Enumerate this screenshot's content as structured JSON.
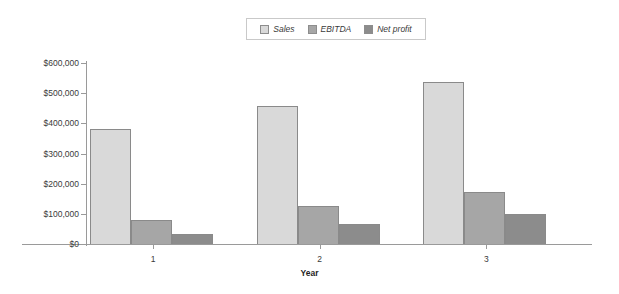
{
  "chart_data": {
    "type": "bar",
    "title": "",
    "xlabel": "Year",
    "ylabel": "",
    "categories": [
      "1",
      "2",
      "3"
    ],
    "series": [
      {
        "name": "Sales",
        "values": [
          380000,
          457000,
          537000
        ],
        "color": "#d9d9d9"
      },
      {
        "name": "EBITDA",
        "values": [
          80000,
          125000,
          172000
        ],
        "color": "#a6a6a6"
      },
      {
        "name": "Net profit",
        "values": [
          33000,
          66000,
          99000
        ],
        "color": "#8c8c8c"
      }
    ],
    "ylim": [
      0,
      600000
    ],
    "yticks": [
      "$0",
      "$100,000",
      "$200,000",
      "$300,000",
      "$400,000",
      "$500,000",
      "$600,000"
    ],
    "ytick_values": [
      0,
      100000,
      200000,
      300000,
      400000,
      500000,
      600000
    ],
    "grid": false,
    "legend_position": "top-center",
    "legend_border_color": "#c9c9c9",
    "axis_color": "#9a9a9a",
    "bar_border_color": "#8a8a8a",
    "background": "#ffffff"
  },
  "legend": {
    "items": [
      {
        "label": "Sales",
        "color": "#d9d9d9"
      },
      {
        "label": "EBITDA",
        "color": "#a6a6a6"
      },
      {
        "label": "Net profit",
        "color": "#8c8c8c"
      }
    ]
  },
  "axes": {
    "x_title": "Year",
    "x_labels": [
      "1",
      "2",
      "3"
    ],
    "y_labels": [
      "$600,000",
      "$500,000",
      "$400,000",
      "$300,000",
      "$200,000",
      "$100,000",
      "$0"
    ]
  }
}
